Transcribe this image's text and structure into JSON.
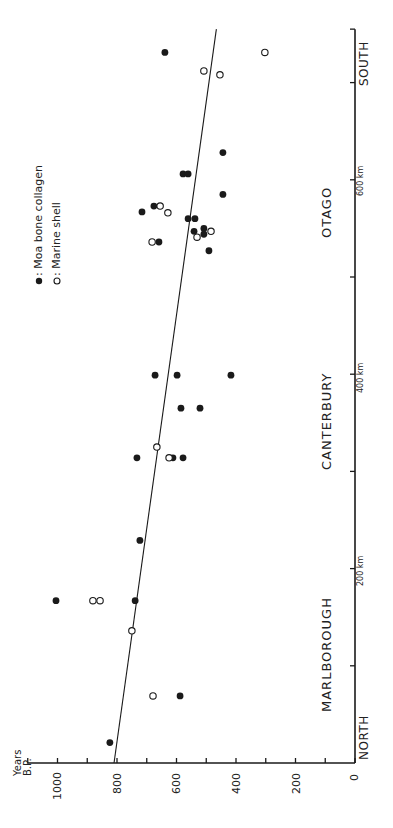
{
  "chart_data": {
    "type": "scatter",
    "title": "",
    "orientation": "rotated 90 degrees counter-clockwise (distance axis vertical on right, years axis horizontal at bottom)",
    "xlabel": "Distance (km, North to South)",
    "ylabel": "Years B.P.",
    "xlim": [
      0,
      755
    ],
    "ylim": [
      0,
      1100
    ],
    "x_ticks": [
      0,
      100,
      200,
      300,
      400,
      500,
      600,
      700
    ],
    "x_tick_labels": [
      {
        "value": 200,
        "label": "200 km"
      },
      {
        "value": 400,
        "label": "400 km"
      },
      {
        "value": 600,
        "label": "600 km"
      }
    ],
    "y_ticks": [
      0,
      100,
      200,
      300,
      400,
      500,
      600,
      700,
      800,
      900,
      1000,
      1100
    ],
    "y_tick_labels": [
      "0",
      "200",
      "400",
      "600",
      "800",
      "1000"
    ],
    "y_tick_label_values": [
      0,
      200,
      400,
      600,
      800,
      1000
    ],
    "grid": false,
    "regions": [
      {
        "label": "MARLBOROUGH",
        "from_km": 52,
        "to_km": 158
      },
      {
        "label": "CANTERBURY",
        "from_km": 300,
        "to_km": 390
      },
      {
        "label": "OTAGO",
        "from_km": 540,
        "to_km": 592
      }
    ],
    "compass": {
      "north": "NORTH",
      "south": "SOUTH"
    },
    "legend": [
      {
        "symbol": "filled",
        "label": "Moa bone collagen"
      },
      {
        "symbol": "open",
        "label": "Marine shell"
      }
    ],
    "legend_separator": ":",
    "regression_line": {
      "x": [
        0,
        755
      ],
      "y": [
        810,
        466
      ]
    },
    "series": [
      {
        "name": "Moa bone collagen",
        "marker": "filled",
        "points": [
          {
            "km": 731,
            "years": 639
          },
          {
            "km": 628,
            "years": 444
          },
          {
            "km": 606,
            "years": 578
          },
          {
            "km": 606,
            "years": 561
          },
          {
            "km": 585,
            "years": 444
          },
          {
            "km": 573,
            "years": 676
          },
          {
            "km": 567,
            "years": 716
          },
          {
            "km": 560,
            "years": 561
          },
          {
            "km": 560,
            "years": 538
          },
          {
            "km": 547,
            "years": 541
          },
          {
            "km": 550,
            "years": 508
          },
          {
            "km": 544,
            "years": 508
          },
          {
            "km": 536,
            "years": 659
          },
          {
            "km": 527,
            "years": 491
          },
          {
            "km": 399,
            "years": 672
          },
          {
            "km": 399,
            "years": 598
          },
          {
            "km": 399,
            "years": 417
          },
          {
            "km": 365,
            "years": 585
          },
          {
            "km": 365,
            "years": 521
          },
          {
            "km": 314,
            "years": 733
          },
          {
            "km": 314,
            "years": 612
          },
          {
            "km": 314,
            "years": 578
          },
          {
            "km": 229,
            "years": 723
          },
          {
            "km": 167,
            "years": 1005
          },
          {
            "km": 167,
            "years": 739
          },
          {
            "km": 69,
            "years": 588
          },
          {
            "km": 21,
            "years": 824
          }
        ]
      },
      {
        "name": "Marine shell",
        "marker": "open",
        "points": [
          {
            "km": 731,
            "years": 303
          },
          {
            "km": 712,
            "years": 508
          },
          {
            "km": 708,
            "years": 454
          },
          {
            "km": 573,
            "years": 655
          },
          {
            "km": 566,
            "years": 629
          },
          {
            "km": 547,
            "years": 484
          },
          {
            "km": 541,
            "years": 531
          },
          {
            "km": 536,
            "years": 682
          },
          {
            "km": 325,
            "years": 666
          },
          {
            "km": 314,
            "years": 625
          },
          {
            "km": 167,
            "years": 881
          },
          {
            "km": 167,
            "years": 857
          },
          {
            "km": 136,
            "years": 750
          },
          {
            "km": 69,
            "years": 679
          }
        ]
      }
    ]
  },
  "labels": {
    "axis_title_line1": "Years",
    "axis_title_line2": "B.P.",
    "north": "NORTH",
    "south": "SOUTH",
    "region_marlborough": "MARLBOROUGH",
    "region_canterbury": "CANTERBURY",
    "region_otago": "OTAGO",
    "km200": "200 km",
    "km400": "400 km",
    "km600": "600 km",
    "legend_moa": ": Moa bone collagen",
    "legend_shell": ": Marine shell",
    "ytick_0": "0",
    "ytick_200": "200",
    "ytick_400": "400",
    "ytick_600": "600",
    "ytick_800": "800",
    "ytick_1000": "1000"
  },
  "colors": {
    "ink": "#1a1a1a",
    "background": "#ffffff"
  }
}
